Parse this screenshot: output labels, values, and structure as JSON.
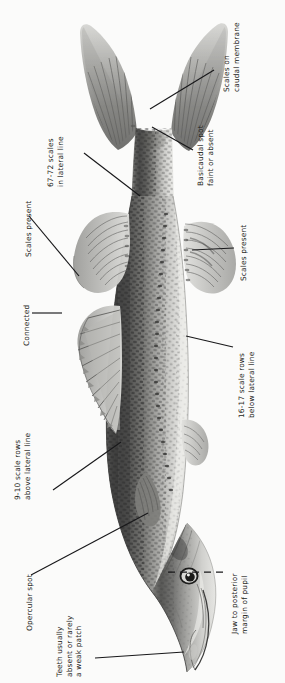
{
  "plate": {
    "subject": "fish-lateral-view",
    "orientation": "rotated-90-degrees",
    "background_color": "#fbfbfa",
    "ink_color": "#18181a"
  },
  "annotations": [
    {
      "id": "scales-on-caudal-membrane",
      "line1": "Scales on",
      "line2": "caudal membrane",
      "target": "caudal-fin-membrane"
    },
    {
      "id": "basicaudal-spot",
      "line1": "Basicaudal spot",
      "line2": "faint or absent",
      "target": "caudal-peduncle-base"
    },
    {
      "id": "lateral-line-scale-count",
      "line1": "67-72 scales",
      "line2": "in lateral line",
      "target": "lateral-line"
    },
    {
      "id": "scales-present-dorsal",
      "line1": "Scales present",
      "line2": "",
      "target": "soft-dorsal-fin"
    },
    {
      "id": "scales-present-anal",
      "line1": "Scales present",
      "line2": "",
      "target": "anal-fin"
    },
    {
      "id": "connected",
      "line1": "Connected",
      "line2": "",
      "target": "dorsal-fin-spines"
    },
    {
      "id": "scale-rows-above-lateral-line",
      "line1": "9-10 scale rows",
      "line2": "above lateral line",
      "target": "dorsum-scale-rows"
    },
    {
      "id": "scale-rows-below-lateral-line",
      "line1": "16-17 scale rows",
      "line2": "below lateral line",
      "target": "ventral-scale-rows"
    },
    {
      "id": "opercular-spot",
      "line1": "Opercular spot",
      "line2": "",
      "target": "operculum"
    },
    {
      "id": "jaw-to-posterior-margin-of-pupil",
      "line1": "Jaw to posterior",
      "line2": "margin of pupil",
      "target": "maxilla-pupil-reference-line"
    },
    {
      "id": "teeth",
      "line1": "Teeth usually",
      "line2": "absent or rarely",
      "line3": "a weak patch",
      "target": "tongue-teeth-patch"
    }
  ]
}
